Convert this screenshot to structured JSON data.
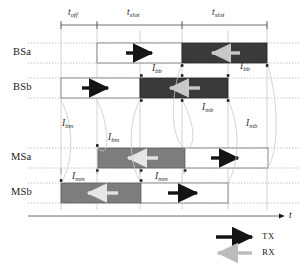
{
  "figure": {
    "type": "timing-diagram",
    "axis": {
      "label": "t"
    }
  },
  "dimensions": [
    {
      "name": "t_off",
      "base": "t",
      "sub": "off",
      "x_start": 61,
      "x_end": 97
    },
    {
      "name": "t_slot_1",
      "base": "t",
      "sub": "slot",
      "x_start": 97,
      "x_end": 182
    },
    {
      "name": "t_slot_2",
      "base": "t",
      "sub": "slot",
      "x_start": 182,
      "x_end": 267
    }
  ],
  "rows": [
    {
      "label": "BSa",
      "blocks": [
        {
          "fill": "white",
          "arrow": "tx",
          "x_start": 97,
          "x_end": 182
        },
        {
          "fill": "dark",
          "arrow": "rx",
          "x_start": 182,
          "x_end": 267
        }
      ]
    },
    {
      "label": "BSb",
      "blocks": [
        {
          "fill": "white",
          "arrow": "tx",
          "x_start": 61,
          "x_end": 140
        },
        {
          "fill": "dark",
          "arrow": "rx",
          "x_start": 140,
          "x_end": 228
        }
      ]
    },
    {
      "label": "MSa",
      "blocks": [
        {
          "fill": "gray",
          "arrow": "rx",
          "x_start": 98,
          "x_end": 185
        },
        {
          "fill": "white",
          "arrow": "tx",
          "x_start": 185,
          "x_end": 268
        }
      ]
    },
    {
      "label": "MSb",
      "blocks": [
        {
          "fill": "gray",
          "arrow": "rx",
          "x_start": 61,
          "x_end": 141
        },
        {
          "fill": "white",
          "arrow": "tx",
          "x_start": 141,
          "x_end": 228
        }
      ]
    }
  ],
  "intervals": [
    {
      "name": "I_bb_left",
      "base": "I",
      "sub": "bb",
      "x": 152,
      "y": 68
    },
    {
      "name": "I_bb_right",
      "base": "I",
      "sub": "bb",
      "x": 240,
      "y": 66
    },
    {
      "name": "I_bm_left",
      "base": "I",
      "sub": "bm",
      "x": 62,
      "y": 122
    },
    {
      "name": "I_bm_right",
      "base": "I",
      "sub": "bm",
      "x": 108,
      "y": 136
    },
    {
      "name": "I_mb_left",
      "base": "I",
      "sub": "mb",
      "x": 202,
      "y": 106
    },
    {
      "name": "I_mb_right",
      "base": "I",
      "sub": "mb",
      "x": 246,
      "y": 122
    },
    {
      "name": "I_mm_left",
      "base": "I",
      "sub": "mm",
      "x": 72,
      "y": 176
    },
    {
      "name": "I_mm_right",
      "base": "I",
      "sub": "mm",
      "x": 155,
      "y": 176
    }
  ],
  "legend": {
    "items": [
      {
        "label": "TX",
        "arrow": "tx",
        "color": "#1a1a1a"
      },
      {
        "label": "RX",
        "arrow": "rx",
        "color": "#b5b5b5"
      }
    ]
  },
  "colors": {
    "dark_block": "#3a3a3a",
    "gray_block": "#7d7d7d",
    "white_block": "#ffffff",
    "tx_arrow": "#141414",
    "rx_arrow_on_dark": "#c8c8c8",
    "rx_arrow_on_gray": "#e2e2e2",
    "outline": "#6e6e6e",
    "guide": "#b9b9b9",
    "dotted": "#9a9a9a"
  }
}
